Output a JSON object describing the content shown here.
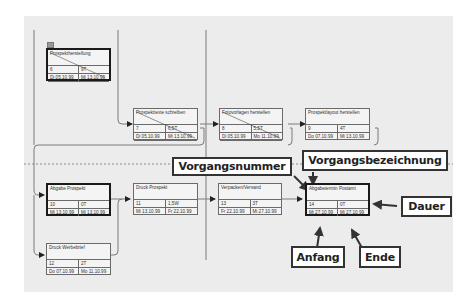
{
  "diagram": {
    "type": "network-plan",
    "nodes": [
      {
        "id": "n6",
        "name": "Prospektherstellung",
        "number": "6",
        "duration": "9T",
        "start": "Di 05.10.99",
        "end": "Mi 13.10.99",
        "critical": true,
        "summary": true
      },
      {
        "id": "n7",
        "name": "Prospekttexte schreiben",
        "number": "7",
        "duration": "6,5T",
        "start": "Di 05.10.99",
        "end": "Mi 13.10.99",
        "critical": false,
        "summary": false
      },
      {
        "id": "n8",
        "name": "Fotovorlagen herstellen",
        "number": "8",
        "duration": "5,5T",
        "start": "Di 05.10.99",
        "end": "Mo 11.10.99",
        "critical": false,
        "summary": false
      },
      {
        "id": "n9",
        "name": "Prospektlayout herstellen",
        "number": "9",
        "duration": "4T",
        "start": "Do 07.10.99",
        "end": "Mi 13.10.99",
        "critical": false,
        "summary": false
      },
      {
        "id": "n10",
        "name": "Abgabe Prospekt",
        "number": "10",
        "duration": "0T",
        "start": "Mi 13.10.99",
        "end": "Mi 13.10.99",
        "critical": true,
        "summary": false
      },
      {
        "id": "n11",
        "name": "Druck Prospekt",
        "number": "11",
        "duration": "1,5W",
        "start": "Mi 13.10.99",
        "end": "Fr 22.10.99",
        "critical": false,
        "summary": false
      },
      {
        "id": "n12",
        "name": "Druck Werbebrief",
        "number": "12",
        "duration": "2T",
        "start": "Do 07.10.99",
        "end": "Mo 11.10.99",
        "critical": false,
        "summary": false
      },
      {
        "id": "n13",
        "name": "Verpacken/Versand",
        "number": "13",
        "duration": "3T",
        "start": "Fr 22.10.99",
        "end": "Mi 27.10.99",
        "critical": false,
        "summary": false
      },
      {
        "id": "n14",
        "name": "Abgabetermin Postamt",
        "number": "14",
        "duration": "0T",
        "start": "Mi 27.10.99",
        "end": "Mi 27.10.99",
        "critical": true,
        "summary": false
      }
    ],
    "callouts": {
      "number": "Vorgangsnummer",
      "name": "Vorgangsbezeichnung",
      "duration": "Dauer",
      "start": "Anfang",
      "end": "Ende"
    }
  }
}
